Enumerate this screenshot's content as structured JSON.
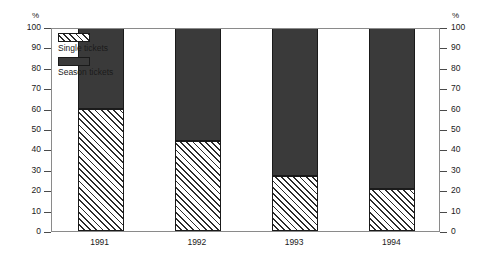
{
  "chart_data": {
    "type": "bar",
    "subtype": "stacked-percentage",
    "title": "",
    "subtitle": "",
    "xlabel": "",
    "ylabel": "%",
    "ylabel_right": "%",
    "categories": [
      "1991",
      "1992",
      "1993",
      "1994"
    ],
    "series": [
      {
        "name": "Single tickets",
        "values": [
          60,
          44,
          27,
          20.5
        ],
        "fill": "diagonal-hatch",
        "color": "#ffffff",
        "hatch_color": "#2b2b2b"
      },
      {
        "name": "Season tickets",
        "values": [
          40,
          56,
          73,
          79.5
        ],
        "fill": "solid",
        "color": "#3a3a3a"
      }
    ],
    "ylim": [
      0,
      100
    ],
    "yticks": [
      0,
      10,
      20,
      30,
      40,
      50,
      60,
      70,
      80,
      90,
      100
    ],
    "ytick_labels": [
      "0",
      "10",
      "20",
      "30",
      "40",
      "50",
      "60",
      "70",
      "80",
      "90",
      "100"
    ],
    "ytick_labels_right": [
      "0",
      "10",
      "20",
      "30",
      "40",
      "50",
      "60",
      "70",
      "80",
      "90",
      "100"
    ],
    "grid": false,
    "legend_position": "top-left",
    "legend_entries": [
      "Single tickets",
      "Season tickets"
    ],
    "frame_color": "#8a8a8a",
    "background": "#ffffff"
  },
  "axes": {
    "unit_left": "%",
    "unit_right": "%"
  },
  "legend": {
    "entries": [
      {
        "label": "Single tickets",
        "pattern": "hatch"
      },
      {
        "label": "Season tickets",
        "pattern": "solid"
      }
    ]
  }
}
